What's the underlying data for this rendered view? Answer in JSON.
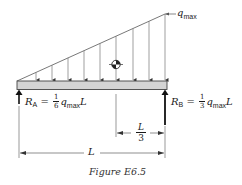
{
  "figure": {
    "caption": "Figure E6.5",
    "load": {
      "type": "triangular distributed load",
      "label_symbol": "q",
      "label_subscript": "max",
      "arrow_count": 9
    },
    "reaction_a": {
      "symbol": "R",
      "subscript": "A",
      "equals": "=",
      "frac_num": "1",
      "frac_den": "6",
      "q": "q",
      "q_sub": "max",
      "length": "L"
    },
    "reaction_b": {
      "symbol": "R",
      "subscript": "B",
      "equals": "=",
      "frac_num": "1",
      "frac_den": "3",
      "q": "q",
      "q_sub": "max",
      "length": "L"
    },
    "dim_third": {
      "num": "L",
      "den": "3"
    },
    "dim_full": {
      "label": "L"
    },
    "centroid_symbol": "centroid-marker"
  },
  "colors": {
    "line": "#333333",
    "beam_fill": "#d4d4d4",
    "beam_stroke": "#444444",
    "text": "#1a1a1a"
  }
}
